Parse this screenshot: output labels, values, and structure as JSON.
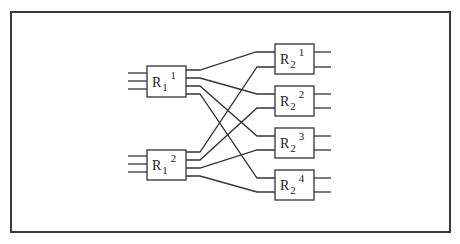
{
  "diagram": {
    "type": "two-stage interconnection network",
    "stage1": [
      {
        "id": "R1_1",
        "base": "R",
        "sub": "1",
        "sup": "1",
        "inputs": 3,
        "outputs": 4
      },
      {
        "id": "R1_2",
        "base": "R",
        "sub": "1",
        "sup": "2",
        "inputs": 3,
        "outputs": 4
      }
    ],
    "stage2": [
      {
        "id": "R2_1",
        "base": "R",
        "sub": "2",
        "sup": "1",
        "inputs": 2,
        "outputs": 2
      },
      {
        "id": "R2_2",
        "base": "R",
        "sub": "2",
        "sup": "2",
        "inputs": 2,
        "outputs": 2
      },
      {
        "id": "R2_3",
        "base": "R",
        "sub": "2",
        "sup": "3",
        "inputs": 2,
        "outputs": 2
      },
      {
        "id": "R2_4",
        "base": "R",
        "sub": "2",
        "sup": "4",
        "inputs": 2,
        "outputs": 2
      }
    ],
    "connections": [
      {
        "from": "R1_1.out1",
        "to": "R2_1.in1"
      },
      {
        "from": "R1_1.out2",
        "to": "R2_2.in1"
      },
      {
        "from": "R1_1.out3",
        "to": "R2_3.in1"
      },
      {
        "from": "R1_1.out4",
        "to": "R2_4.in1"
      },
      {
        "from": "R1_2.out1",
        "to": "R2_1.in2"
      },
      {
        "from": "R1_2.out2",
        "to": "R2_2.in2"
      },
      {
        "from": "R1_2.out3",
        "to": "R2_3.in2"
      },
      {
        "from": "R1_2.out4",
        "to": "R2_4.in2"
      }
    ],
    "colors": {
      "line": "#333333",
      "background": "#ffffff"
    }
  }
}
